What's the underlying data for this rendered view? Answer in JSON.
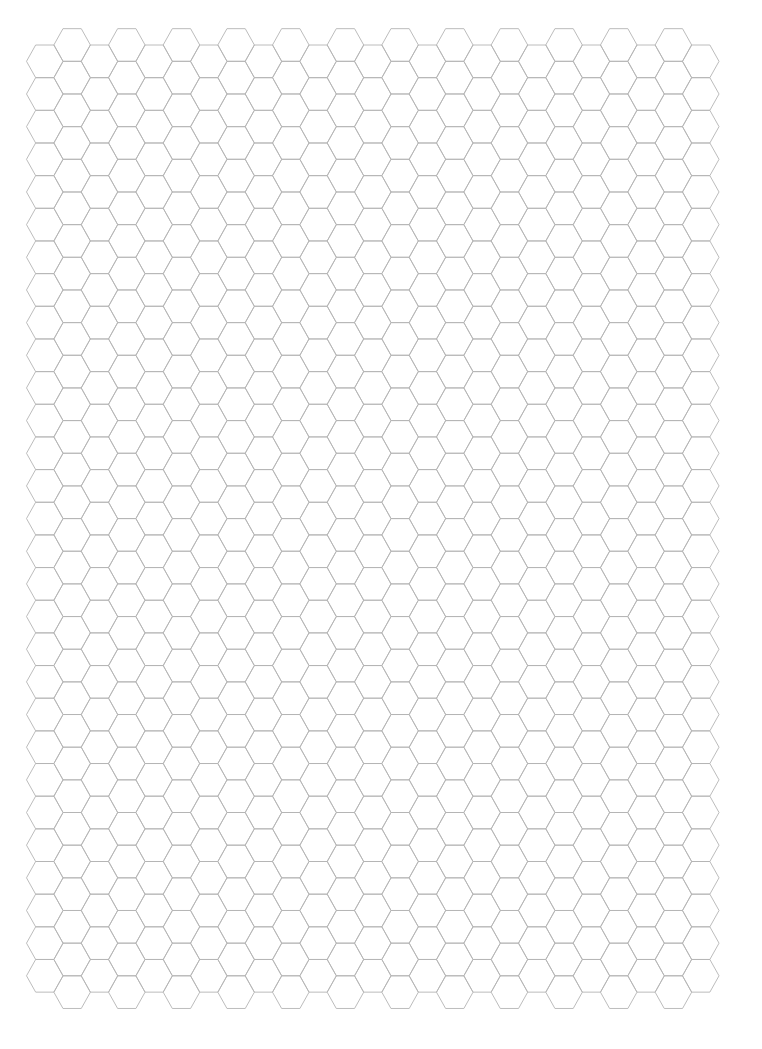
{
  "page": {
    "type": "hexagonal graph paper",
    "background": "#ffffff"
  },
  "grid": {
    "orientation": "flat-top",
    "columns": 25,
    "origin_x": 26.5,
    "origin_y": 45,
    "hex_half_width": 18.3,
    "column_step": 27.33,
    "row_height": 32.66,
    "even_column_rows": 29,
    "odd_column_rows": 30,
    "odd_column_offset_y": -16.33,
    "stroke_color": "#b4b4b4",
    "stroke_width": 0.9
  }
}
